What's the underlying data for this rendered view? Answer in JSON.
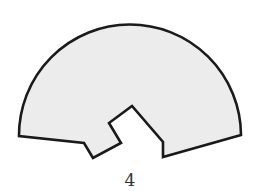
{
  "figure": {
    "label": "4",
    "shape": {
      "description": "semicircular sector shape with a notched cutout along the bottom edge",
      "fill_color": "#ececec",
      "stroke_color": "#1a1a1a"
    }
  }
}
